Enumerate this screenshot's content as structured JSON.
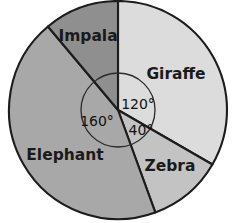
{
  "chart_data": {
    "type": "pie",
    "title": "",
    "subtitle": "",
    "xlabel": "",
    "ylabel": "",
    "legend_position": "none",
    "grid": false,
    "total_degrees": 360,
    "center": {
      "x": 118,
      "y": 110
    },
    "radius": 109,
    "inner_arc_radius": 37,
    "start_angle_deg": 0,
    "direction": "clockwise",
    "categories": [
      "Giraffe",
      "Zebra",
      "Elephant",
      "Impala"
    ],
    "values": [
      120,
      40,
      160,
      40
    ],
    "slices": [
      {
        "label": "Giraffe",
        "angle_deg": 120,
        "angle_text": "120°",
        "color": "#dcdcdc",
        "start_deg": 0,
        "end_deg": 120,
        "label_x": 176,
        "label_y": 74,
        "angle_label_x": 138,
        "angle_label_y": 105,
        "show_angle_label": true
      },
      {
        "label": "Zebra",
        "angle_deg": 40,
        "angle_text": "40°",
        "color": "#c3c3c3",
        "start_deg": 120,
        "end_deg": 160,
        "label_x": 170,
        "label_y": 166,
        "angle_label_x": 141,
        "angle_label_y": 131,
        "show_angle_label": true
      },
      {
        "label": "Elephant",
        "angle_deg": 160,
        "angle_text": "160°",
        "color": "#a8a8a8",
        "start_deg": 160,
        "end_deg": 320,
        "label_x": 65,
        "label_y": 155,
        "angle_label_x": 97,
        "angle_label_y": 122,
        "show_angle_label": true
      },
      {
        "label": "Impala",
        "angle_deg": 40,
        "angle_text": "",
        "color": "#8f8f8f",
        "start_deg": 320,
        "end_deg": 360,
        "label_x": 88,
        "label_y": 36,
        "angle_label_x": 0,
        "angle_label_y": 0,
        "show_angle_label": false
      }
    ],
    "colors": {
      "giraffe": "#dcdcdc",
      "zebra": "#c3c3c3",
      "elephant": "#a8a8a8",
      "impala": "#8f8f8f",
      "outline": "#1c1c1c",
      "background": "#ffffff",
      "text": "#1a1a1a"
    }
  }
}
